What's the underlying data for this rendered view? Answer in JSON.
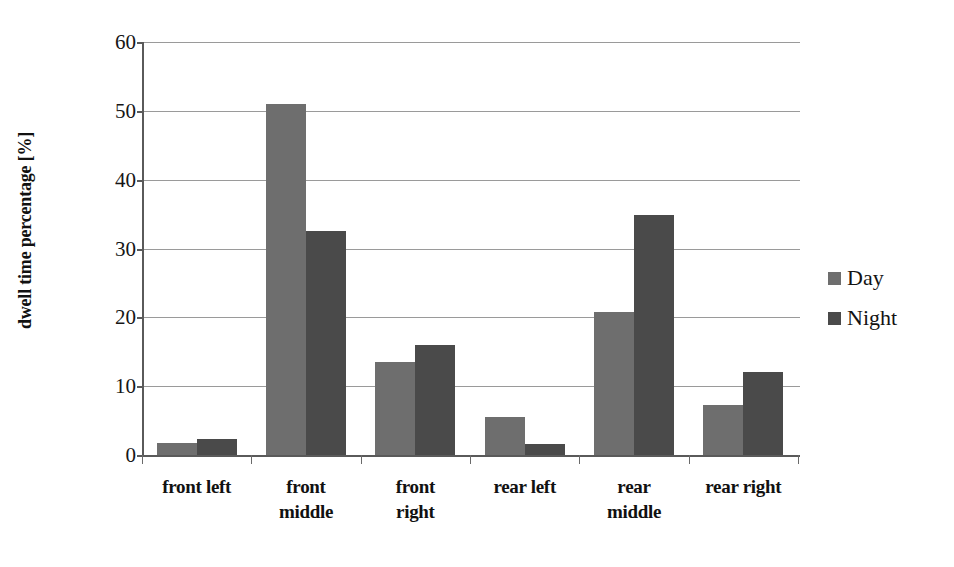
{
  "chart_data": {
    "type": "bar",
    "title": "",
    "xlabel": "",
    "ylabel": "dwell time percentage [%]",
    "ylim": [
      0,
      60
    ],
    "yticks": [
      0,
      10,
      20,
      30,
      40,
      50,
      60
    ],
    "grid": true,
    "legend_position": "right",
    "categories": [
      "front left",
      "front middle",
      "front right",
      "rear left",
      "rear middle",
      "rear right"
    ],
    "series": [
      {
        "name": "Day",
        "color": "#6e6e6e",
        "values": [
          1.8,
          51.0,
          13.5,
          5.5,
          20.8,
          7.3
        ]
      },
      {
        "name": "Night",
        "color": "#4a4a4a",
        "values": [
          2.3,
          32.5,
          16.0,
          1.6,
          34.9,
          12.0
        ]
      }
    ]
  },
  "axis": {
    "y_title": "dwell time percentage [%]",
    "tick_labels": [
      "60",
      "50",
      "40",
      "30",
      "20",
      "10",
      "0"
    ]
  },
  "legend": {
    "items": [
      {
        "label": "Day",
        "color": "#6e6e6e"
      },
      {
        "label": "Night",
        "color": "#4a4a4a"
      }
    ]
  },
  "xlabels": [
    {
      "line1": "front left",
      "line2": ""
    },
    {
      "line1": "front",
      "line2": "middle"
    },
    {
      "line1": "front",
      "line2": "right"
    },
    {
      "line1": "rear left",
      "line2": ""
    },
    {
      "line1": "rear",
      "line2": "middle"
    },
    {
      "line1": "rear right",
      "line2": ""
    }
  ]
}
